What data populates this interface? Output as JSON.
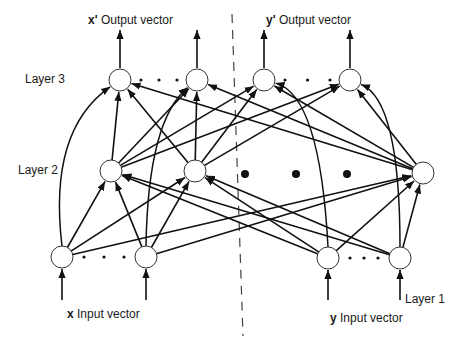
{
  "diagram": {
    "type": "autoassociative-neural-network",
    "labels": {
      "layer3": "Layer 3",
      "layer2": "Layer 2",
      "layer1": "Layer 1",
      "x_output_var": "x'",
      "x_output_text": "Output vector",
      "y_output_var": "y'",
      "y_output_text": "Output vector",
      "x_input_var": "x",
      "x_input_text": "Input vector",
      "y_input_var": "y",
      "y_input_text": "Input vector"
    },
    "colors": {
      "line": "#111111",
      "node_fill": "#ffffff",
      "node_stroke": "#333333",
      "divider": "#444444"
    },
    "node_radius": 11,
    "layers": {
      "layer3": [
        {
          "id": "L3a",
          "x": 120,
          "y": 80
        },
        {
          "id": "L3b",
          "x": 197,
          "y": 80
        },
        {
          "id": "L3c",
          "x": 264,
          "y": 80
        },
        {
          "id": "L3d",
          "x": 350,
          "y": 80
        }
      ],
      "layer2": [
        {
          "id": "L2a",
          "x": 111,
          "y": 171
        },
        {
          "id": "L2b",
          "x": 195,
          "y": 171
        },
        {
          "id": "L2c",
          "x": 423,
          "y": 173
        }
      ],
      "layer1": [
        {
          "id": "L1a",
          "x": 62,
          "y": 257
        },
        {
          "id": "L1b",
          "x": 146,
          "y": 257
        },
        {
          "id": "L1c",
          "x": 328,
          "y": 258
        },
        {
          "id": "L1d",
          "x": 400,
          "y": 258
        }
      ]
    },
    "ellipses": [
      {
        "x1": 141,
        "x2": 177,
        "y": 80,
        "size": "small"
      },
      {
        "x1": 285,
        "x2": 330,
        "y": 80,
        "size": "small"
      },
      {
        "x1": 84,
        "x2": 124,
        "y": 257,
        "size": "small"
      },
      {
        "x1": 350,
        "x2": 378,
        "y": 258,
        "size": "small"
      },
      {
        "x1": 245,
        "x2": 347,
        "y": 174,
        "size": "large"
      }
    ],
    "edges_straight": [
      [
        "L1a",
        "L2a"
      ],
      [
        "L1a",
        "L2b"
      ],
      [
        "L1a",
        "L2c"
      ],
      [
        "L1b",
        "L2a"
      ],
      [
        "L1b",
        "L2b"
      ],
      [
        "L1b",
        "L2c"
      ],
      [
        "L1c",
        "L2a"
      ],
      [
        "L1c",
        "L2b"
      ],
      [
        "L1c",
        "L2c"
      ],
      [
        "L1d",
        "L2a"
      ],
      [
        "L1d",
        "L2b"
      ],
      [
        "L1d",
        "L2c"
      ],
      [
        "L2a",
        "L3a"
      ],
      [
        "L2a",
        "L3b"
      ],
      [
        "L2a",
        "L3c"
      ],
      [
        "L2a",
        "L3d"
      ],
      [
        "L2b",
        "L3a"
      ],
      [
        "L2b",
        "L3b"
      ],
      [
        "L2b",
        "L3c"
      ],
      [
        "L2b",
        "L3d"
      ],
      [
        "L2c",
        "L3a"
      ],
      [
        "L2c",
        "L3b"
      ],
      [
        "L2c",
        "L3c"
      ],
      [
        "L2c",
        "L3d"
      ]
    ],
    "edges_curved": [
      {
        "from": "L1a",
        "to": "L3a",
        "cx": 48,
        "cy": 130
      },
      {
        "from": "L1b",
        "to": "L3b",
        "cx": 148,
        "cy": 120
      },
      {
        "from": "L1c",
        "to": "L3c",
        "cx": 320,
        "cy": 95
      },
      {
        "from": "L1d",
        "to": "L3d",
        "cx": 400,
        "cy": 100
      }
    ],
    "io_arrows": [
      {
        "x": 120,
        "y1": 68,
        "y2": 30,
        "dir": "up"
      },
      {
        "x": 197,
        "y1": 68,
        "y2": 30,
        "dir": "up"
      },
      {
        "x": 264,
        "y1": 68,
        "y2": 30,
        "dir": "up"
      },
      {
        "x": 350,
        "y1": 68,
        "y2": 30,
        "dir": "up"
      },
      {
        "x": 62,
        "y1": 300,
        "y2": 269,
        "dir": "up"
      },
      {
        "x": 146,
        "y1": 300,
        "y2": 269,
        "dir": "up"
      },
      {
        "x": 328,
        "y1": 300,
        "y2": 270,
        "dir": "up"
      },
      {
        "x": 400,
        "y1": 300,
        "y2": 270,
        "dir": "up"
      }
    ],
    "divider": {
      "x1": 232,
      "y1": 14,
      "x2": 243,
      "y2": 336
    }
  }
}
